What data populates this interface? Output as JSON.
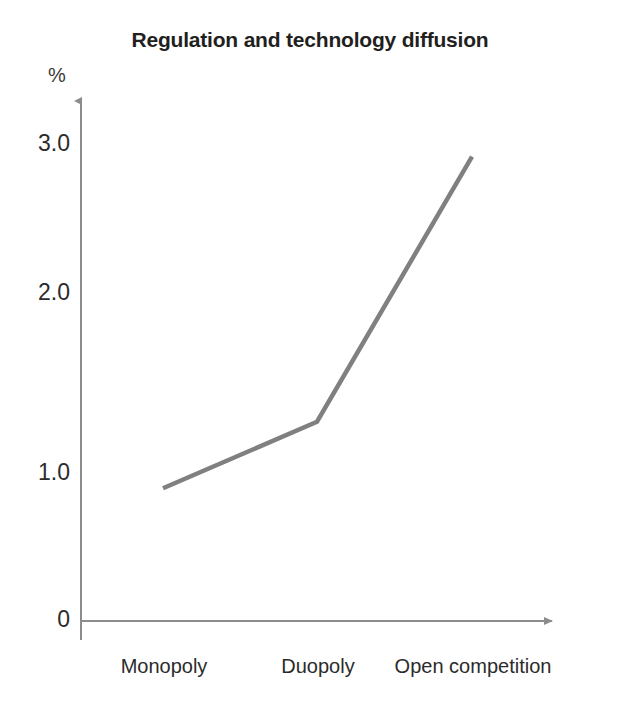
{
  "chart_data": {
    "type": "line",
    "title": "Regulation and technology diffusion",
    "xlabel": "",
    "ylabel": "%",
    "categories": [
      "Monopoly",
      "Duopoly",
      "Open competition"
    ],
    "series": [
      {
        "name": "technology diffusion",
        "values": [
          0.83,
          1.25,
          2.92
        ],
        "color": "#808080"
      }
    ],
    "yticks": [
      "3.0",
      "2.0",
      "1.0",
      "0"
    ],
    "ytick_values": [
      3.0,
      2.0,
      1.0,
      0
    ],
    "ylim": [
      0,
      3.3
    ],
    "grid": false,
    "legend": "none",
    "axis_color": "#8c8c8c",
    "axis_arrows": true
  },
  "axis": {
    "unit_label": "%"
  },
  "ticks": {
    "y": [
      {
        "label": "3.0",
        "y": 144
      },
      {
        "label": "2.0",
        "y": 293
      },
      {
        "label": "1.0",
        "y": 473
      },
      {
        "label": "0",
        "y": 620
      }
    ],
    "x": [
      {
        "label": "Monopoly",
        "x": 164,
        "y": 666
      },
      {
        "label": "Duopoly",
        "x": 318,
        "y": 666
      },
      {
        "label": "Open competition",
        "x": 473,
        "y": 666
      }
    ]
  }
}
